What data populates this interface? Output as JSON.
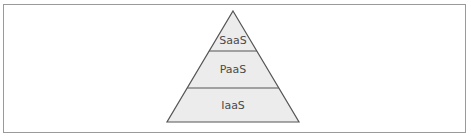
{
  "diagram": {
    "type": "pyramid",
    "colors": {
      "fill": "#ececec",
      "stroke": "#555555",
      "text": "#4a4a4a",
      "frame_border": "#9a9a9a"
    },
    "layers": [
      {
        "label": "SaaS",
        "position": "top"
      },
      {
        "label": "PaaS",
        "position": "middle"
      },
      {
        "label": "IaaS",
        "position": "bottom"
      }
    ]
  }
}
